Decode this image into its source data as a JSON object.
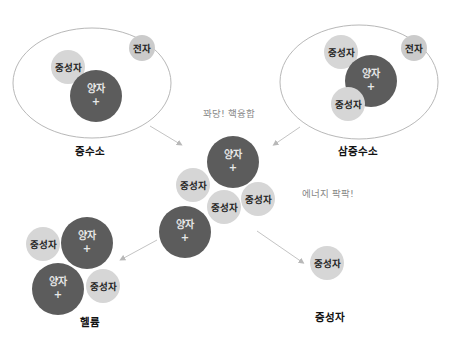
{
  "colors": {
    "proton": "#5a5a5a",
    "neutron": "#d4d4d4",
    "electron": "#c8c8c8",
    "orbit": "#b0b0b0",
    "arrow": "#c0c0c0",
    "label": "#111111",
    "note": "#888888"
  },
  "particles": {
    "proton": "양자",
    "proton_sign": "+",
    "neutron": "중성자",
    "electron": "전자"
  },
  "atoms": {
    "deuterium": {
      "label": "중수소"
    },
    "tritium": {
      "label": "삼중수소"
    },
    "helium": {
      "label": "헬륨"
    },
    "neutron": {
      "label": "중성자"
    }
  },
  "notes": {
    "fusion": "꽈당! 핵융합",
    "energy": "에너지 팍팍!"
  }
}
